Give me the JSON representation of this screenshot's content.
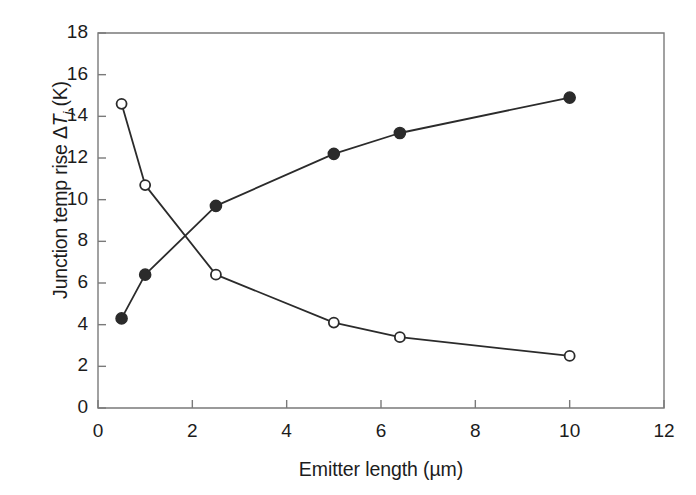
{
  "chart_data": {
    "type": "line",
    "title": "",
    "xlabel_parts": {
      "text": "Emitter length (µm)"
    },
    "ylabel_parts": {
      "prefix": "Junction temp rise Δ",
      "italic": "T",
      "subscript": "j",
      "suffix": " (K)"
    },
    "xlabel": "Emitter length (µm)",
    "ylabel": "Junction temp rise ΔTj (K)",
    "xlim": [
      0,
      12
    ],
    "ylim": [
      0,
      18
    ],
    "xticks": [
      0,
      2,
      4,
      6,
      8,
      10,
      12
    ],
    "xtick_labels": [
      "0",
      "2",
      "4",
      "6",
      "8",
      "10",
      "12"
    ],
    "yticks": [
      0,
      2,
      4,
      6,
      8,
      10,
      12,
      14,
      16,
      18
    ],
    "ytick_labels": [
      "0",
      "2",
      "4",
      "6",
      "8",
      "10",
      "12",
      "14",
      "16",
      "18"
    ],
    "grid": false,
    "legend": "none",
    "series": [
      {
        "name": "filled-circle-series",
        "marker": "filled-circle",
        "color": "#2b2b2b",
        "x": [
          0.5,
          1.0,
          2.5,
          5.0,
          6.4,
          10.0
        ],
        "values": [
          4.3,
          6.4,
          9.7,
          12.2,
          13.2,
          14.9
        ]
      },
      {
        "name": "open-circle-series",
        "marker": "open-circle",
        "color": "#2b2b2b",
        "x": [
          0.5,
          1.0,
          2.5,
          5.0,
          6.4,
          10.0
        ],
        "values": [
          14.6,
          10.7,
          6.4,
          4.1,
          3.4,
          2.5
        ]
      }
    ]
  },
  "style": {
    "axis_color": "#7a7a7a",
    "line_color": "#2b2b2b",
    "marker_fill": "#2b2b2b",
    "marker_open_fill": "#ffffff",
    "background": "#ffffff"
  }
}
